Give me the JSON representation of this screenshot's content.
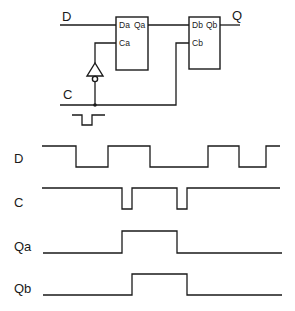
{
  "circuit": {
    "inputs": {
      "d_label": "D",
      "c_label": "C"
    },
    "output": {
      "q_label": "Q"
    },
    "flipflop_a": {
      "d_pin": "Da",
      "q_pin": "Qa",
      "c_pin": "Ca"
    },
    "flipflop_b": {
      "d_pin": "Db",
      "q_pin": "Qb",
      "c_pin": "Cb"
    },
    "inverter": "clock inverter on Ca",
    "clock_symbol": "negative pulse"
  },
  "timing": {
    "signals": [
      {
        "label": "D",
        "high_y": 146,
        "low_y": 167,
        "points": [
          [
            42,
            "H"
          ],
          [
            76,
            "L"
          ],
          [
            108,
            "H"
          ],
          [
            150,
            "L"
          ],
          [
            208,
            "H"
          ],
          [
            239,
            "L"
          ],
          [
            266,
            "H"
          ],
          [
            280,
            "end"
          ]
        ]
      },
      {
        "label": "C",
        "high_y": 188,
        "low_y": 209,
        "points": [
          [
            42,
            "H"
          ],
          [
            122,
            "L"
          ],
          [
            132,
            "H"
          ],
          [
            177,
            "L"
          ],
          [
            187,
            "H"
          ],
          [
            280,
            "end"
          ]
        ]
      },
      {
        "label": "Qa",
        "high_y": 231,
        "low_y": 253,
        "points": [
          [
            43,
            "L"
          ],
          [
            122,
            "H"
          ],
          [
            177,
            "L"
          ],
          [
            282,
            "end"
          ]
        ]
      },
      {
        "label": "Qb",
        "high_y": 274,
        "low_y": 295,
        "points": [
          [
            43,
            "L"
          ],
          [
            132,
            "H"
          ],
          [
            187,
            "L"
          ],
          [
            282,
            "end"
          ]
        ]
      }
    ]
  }
}
